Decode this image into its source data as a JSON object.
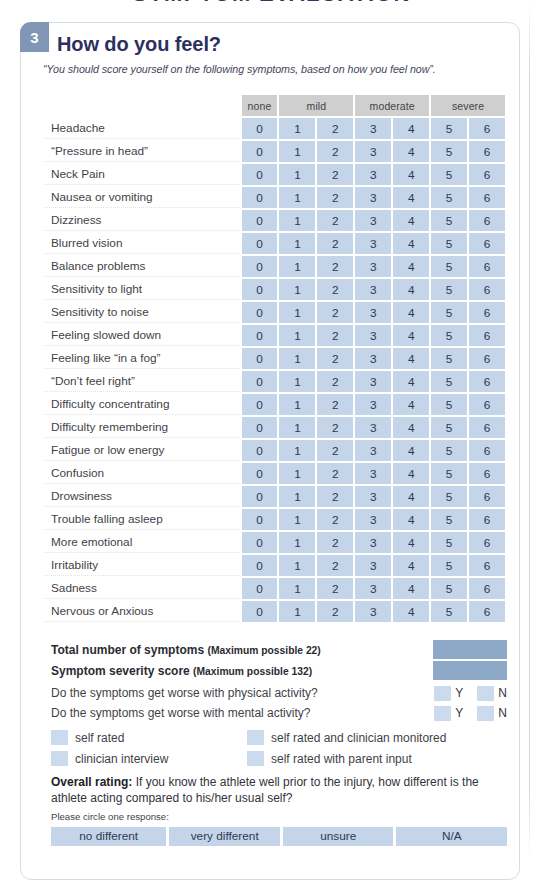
{
  "top_heading": "SYMPTOM EVALUATION",
  "card": {
    "badge": "3",
    "title": "How do you feel?",
    "subtitle": "“You should score yourself on the following symptoms, based on how you feel now”."
  },
  "table": {
    "group_headers": [
      {
        "label": "none",
        "span": 1
      },
      {
        "label": "mild",
        "span": 2
      },
      {
        "label": "moderate",
        "span": 2
      },
      {
        "label": "severe",
        "span": 2
      }
    ],
    "scale": [
      "0",
      "1",
      "2",
      "3",
      "4",
      "5",
      "6"
    ],
    "symptoms": [
      "Headache",
      "“Pressure in head”",
      "Neck Pain",
      "Nausea or vomiting",
      "Dizziness",
      "Blurred vision",
      "Balance problems",
      "Sensitivity to light",
      "Sensitivity to noise",
      "Feeling slowed down",
      "Feeling like “in a fog”",
      "“Don’t feel right”",
      "Difficulty concentrating",
      "Difficulty remembering",
      "Fatigue or low energy",
      "Confusion",
      "Drowsiness",
      "Trouble falling asleep",
      "More emotional",
      "Irritability",
      "Sadness",
      "Nervous or Anxious"
    ]
  },
  "totals": [
    {
      "bold": "Total number of symptoms",
      "max": "(Maximum possible 22)",
      "value": ""
    },
    {
      "bold": "Symptom severity score",
      "max": "(Maximum possible 132)",
      "value": ""
    }
  ],
  "worse_questions": [
    {
      "text": "Do the symptoms get worse with physical activity?",
      "yes": "Y",
      "no": "N"
    },
    {
      "text": "Do the symptoms get worse with mental activity?",
      "yes": "Y",
      "no": "N"
    }
  ],
  "rating_methods": [
    {
      "col1": "self rated",
      "col2": "self rated and clinician monitored"
    },
    {
      "col1": "clinician interview",
      "col2": "self rated with parent input"
    }
  ],
  "overall": {
    "bold_lead": "Overall rating:",
    "body": " If you know the athlete well prior to the injury, how different is the athlete acting compared to his/her usual self?",
    "instruction": "Please circle one response:",
    "choices": [
      "no different",
      "very different",
      "unsure",
      "N/A"
    ]
  },
  "colors": {
    "badge_bg": "#8196b4",
    "title": "#2c3061",
    "cell_blue": "#c4d4e9",
    "group_gray": "#cfcfcf",
    "total_blue": "#8ea8c7",
    "checkbox_blue": "#ccdaed",
    "card_border": "#d3dce8"
  }
}
